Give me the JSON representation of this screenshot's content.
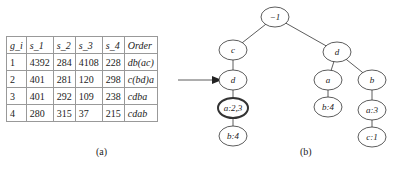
{
  "table": {
    "headers": [
      "g_i",
      "s_1",
      "s_2",
      "s_3",
      "s_4",
      "Order"
    ],
    "rows": [
      [
        "1",
        "4392",
        "284",
        "4108",
        "228",
        "db(ac)"
      ],
      [
        "2",
        "401",
        "281",
        "120",
        "298",
        "c(bd)a"
      ],
      [
        "3",
        "401",
        "292",
        "109",
        "238",
        "cdba"
      ],
      [
        "4",
        "280",
        "315",
        "37",
        "215",
        "cdab"
      ]
    ]
  },
  "captions": {
    "a": "(a)",
    "b": "(b)"
  },
  "tree": {
    "nodes": [
      {
        "label": "−1"
      },
      {
        "label": "c"
      },
      {
        "label": "d"
      },
      {
        "label": "a:2,3"
      },
      {
        "label": "b:4"
      },
      {
        "label": "d"
      },
      {
        "label": "a"
      },
      {
        "label": "b"
      },
      {
        "label": "b:4"
      },
      {
        "label": "a:3"
      },
      {
        "label": "c:1"
      }
    ]
  }
}
